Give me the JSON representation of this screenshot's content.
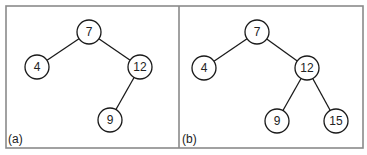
{
  "figure": {
    "panels": [
      {
        "label": "(a)",
        "nodes": [
          {
            "id": "a7",
            "value": "7",
            "x": 89,
            "y": 32
          },
          {
            "id": "a4",
            "value": "4",
            "x": 37,
            "y": 67
          },
          {
            "id": "a12",
            "value": "12",
            "x": 140,
            "y": 67
          },
          {
            "id": "a9",
            "value": "9",
            "x": 110,
            "y": 120
          }
        ],
        "edges": [
          [
            "a7",
            "a4"
          ],
          [
            "a7",
            "a12"
          ],
          [
            "a12",
            "a9"
          ]
        ]
      },
      {
        "label": "(b)",
        "nodes": [
          {
            "id": "b7",
            "value": "7",
            "x": 257,
            "y": 32
          },
          {
            "id": "b4",
            "value": "4",
            "x": 204,
            "y": 68
          },
          {
            "id": "b12",
            "value": "12",
            "x": 307,
            "y": 68
          },
          {
            "id": "b9",
            "value": "9",
            "x": 277,
            "y": 121
          },
          {
            "id": "b15",
            "value": "15",
            "x": 336,
            "y": 121
          }
        ],
        "edges": [
          [
            "b7",
            "b4"
          ],
          [
            "b7",
            "b12"
          ],
          [
            "b12",
            "b9"
          ],
          [
            "b12",
            "b15"
          ]
        ]
      }
    ],
    "colors": {
      "frame": "#8a8a8a",
      "stroke": "#1a1a1a",
      "background": "#ffffff"
    }
  }
}
